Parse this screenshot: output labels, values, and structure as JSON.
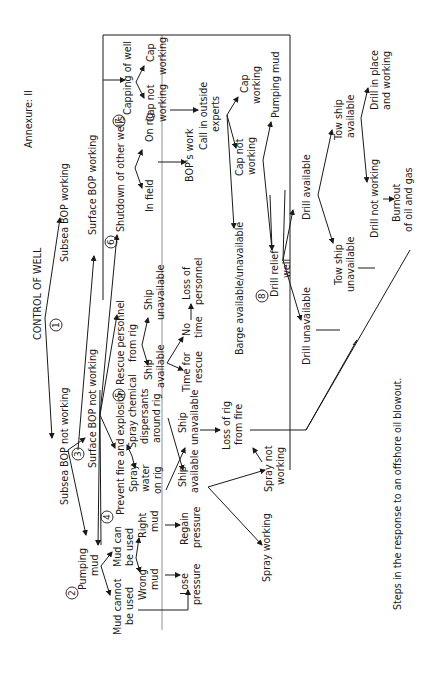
{
  "header": {
    "annexure": "Annexure: II"
  },
  "caption": "Steps in the response to an offshore oil blowout.",
  "steps": {
    "s1": "1",
    "s2": "2",
    "s3": "3",
    "s4": "4",
    "s5": "5",
    "s6": "6",
    "s7": "7",
    "s8": "8"
  },
  "nodes": {
    "control_of_well": "CONTROL OF WELL",
    "subsea_bop_working": "Subsea BOP working",
    "subsea_bop_not_working": "Subsea BOP not working",
    "surface_bop_working": "Surface BOP working",
    "surface_bop_not_working": "Surface BOP not working",
    "pumping_mud_1": "Pumping",
    "pumping_mud_2": "mud",
    "mud_cannot_be_used_1": "Mud cannot",
    "mud_cannot_be_used_2": "be used",
    "mud_can_be_used_1": "Mud can",
    "mud_can_be_used_2": "be used",
    "wrong_mud_1": "Wrong",
    "wrong_mud_2": "mud",
    "right_mud_1": "Right",
    "right_mud_2": "mud",
    "lose_pressure_1": "Lose",
    "lose_pressure_2": "pressure",
    "regain_pressure_1": "Regain",
    "regain_pressure_2": "pressure",
    "prevent_fire": "Prevent fire and explosion",
    "spray_water_1": "Spray",
    "spray_water_2": "water",
    "spray_water_3": "on rig",
    "spray_chemical_1": "Spray chemical",
    "spray_chemical_2": "dispersants",
    "spray_chemical_3": "around rig",
    "ship_available_a_1": "Ship",
    "ship_available_a_2": "available",
    "ship_unavailable_a_1": "Ship",
    "ship_unavailable_a_2": "unavailable",
    "spray_working": "Spray working",
    "spray_not_working_1": "Spray not",
    "spray_not_working_2": "working",
    "loss_of_rig_1": "Loss of rig",
    "loss_of_rig_2": "from fire",
    "rescue_personnel_1": "Rescue personnel",
    "rescue_personnel_2": "from rig",
    "ship_available_b_1": "Ship",
    "ship_available_b_2": "available",
    "ship_unavailable_b_1": "Ship",
    "ship_unavailable_b_2": "unavailable",
    "time_for_rescue_1": "Time for",
    "time_for_rescue_2": "rescue",
    "no_time_1": "No",
    "no_time_2": "time",
    "loss_of_personnel_1": "Loss of",
    "loss_of_personnel_2": "personnel",
    "shutdown_other_wells": "Shutdown of other wells",
    "in_field": "In field",
    "on_rig": "On rig",
    "bops_work": "BOP's work",
    "capping_of_well": "Capping of well",
    "cap_working_a_1": "Cap",
    "cap_working_a_2": "working",
    "cap_not_working_a_1": "Cap not",
    "cap_not_working_a_2": "working",
    "call_outside_experts_1": "Call in outside",
    "call_outside_experts_2": "experts",
    "cap_working_b_1": "Cap",
    "cap_working_b_2": "working",
    "cap_not_working_b_1": "Cap not",
    "cap_not_working_b_2": "working",
    "pumping_mud_b": "Pumping mud",
    "barge": "Barge available/unavailable",
    "drill_relief_well_1": "Drill relief",
    "drill_relief_well_2": "well",
    "drill_available": "Drill available",
    "drill_unavailable": "Drill unavailable",
    "tow_ship_available_1": "Tow ship",
    "tow_ship_available_2": "available",
    "tow_ship_unavailable_1": "Tow ship",
    "tow_ship_unavailable_2": "unavailable",
    "drill_in_place_1": "Drill in place",
    "drill_in_place_2": "and working",
    "drill_not_working": "Drill not working",
    "burnout_1": "Burnout",
    "burnout_2": "of oil and gas"
  }
}
